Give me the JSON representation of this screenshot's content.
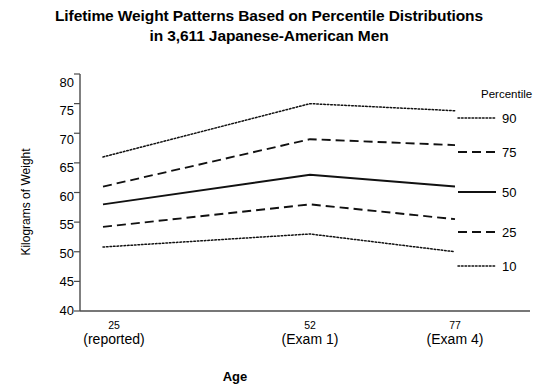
{
  "title": {
    "line1": "Lifetime Weight Patterns Based on Percentile Distributions",
    "line2": "in 3,611 Japanese-American Men"
  },
  "axes": {
    "ylabel": "Kilograms of Weight",
    "xlabel": "Age",
    "yticks": [
      "80",
      "75",
      "70",
      "65",
      "60",
      "55",
      "50",
      "45",
      "40"
    ],
    "xticks": [
      {
        "age": "25",
        "sub": "(reported)"
      },
      {
        "age": "52",
        "sub": "(Exam 1)"
      },
      {
        "age": "77",
        "sub": "(Exam 4)"
      }
    ]
  },
  "legend": {
    "title": "Percentile",
    "items": [
      {
        "label": "90",
        "style": "dotted"
      },
      {
        "label": "75",
        "style": "dashed"
      },
      {
        "label": "50",
        "style": "solid"
      },
      {
        "label": "25",
        "style": "dashed"
      },
      {
        "label": "10",
        "style": "dotted"
      }
    ]
  },
  "chart_data": {
    "type": "line",
    "title": "Lifetime Weight Patterns Based on Percentile Distributions in 3,611 Japanese-American Men",
    "xlabel": "Age",
    "ylabel": "Kilograms of Weight",
    "x": [
      25,
      52,
      77
    ],
    "x_tick_labels": [
      "25 (reported)",
      "52 (Exam 1)",
      "77 (Exam 4)"
    ],
    "ylim": [
      40,
      80
    ],
    "ytick_step": 5,
    "grid": false,
    "legend_position": "right",
    "series": [
      {
        "name": "90",
        "percentile": 90,
        "style": "dotted",
        "values": [
          66.0,
          75.0,
          73.8
        ]
      },
      {
        "name": "75",
        "percentile": 75,
        "style": "dashed",
        "values": [
          61.0,
          69.0,
          68.0
        ]
      },
      {
        "name": "50",
        "percentile": 50,
        "style": "solid",
        "values": [
          58.0,
          63.0,
          61.0
        ]
      },
      {
        "name": "25",
        "percentile": 25,
        "style": "dashed",
        "values": [
          54.2,
          58.0,
          55.5
        ]
      },
      {
        "name": "10",
        "percentile": 10,
        "style": "dotted",
        "values": [
          50.8,
          53.0,
          50.0
        ]
      }
    ]
  }
}
